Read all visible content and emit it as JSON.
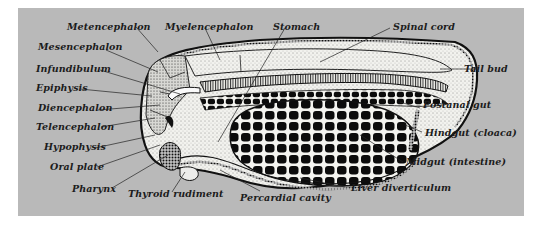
{
  "figure": {
    "background_color": "#b9b9b9",
    "ink_color": "#1c1c1c",
    "labels": {
      "metencephalon": "Metencephalon",
      "myelencephalon": "Myelencephalon",
      "stomach": "Stomach",
      "spinal_cord": "Spinal cord",
      "mesencephalon": "Mesencephalon",
      "infundibulum": "Infundibulum",
      "epiphysis": "Epiphysis",
      "diencephalon": "Diencephalon",
      "telencephalon": "Telencephalon",
      "hypophysis": "Hypophysis",
      "oral_plate": "Oral plate",
      "pharynx": "Pharynx",
      "thyroid_rudiment": "Thyroid rudiment",
      "percardial_cavity": "Percardial cavity",
      "liver_diverticulum": "Liver diverticulum",
      "midgut": "Midgut (intestine)",
      "hindgut": "Hindgut (cloaca)",
      "postanal_gut": "Postanal gut",
      "tail_bud": "Tail bud"
    }
  }
}
